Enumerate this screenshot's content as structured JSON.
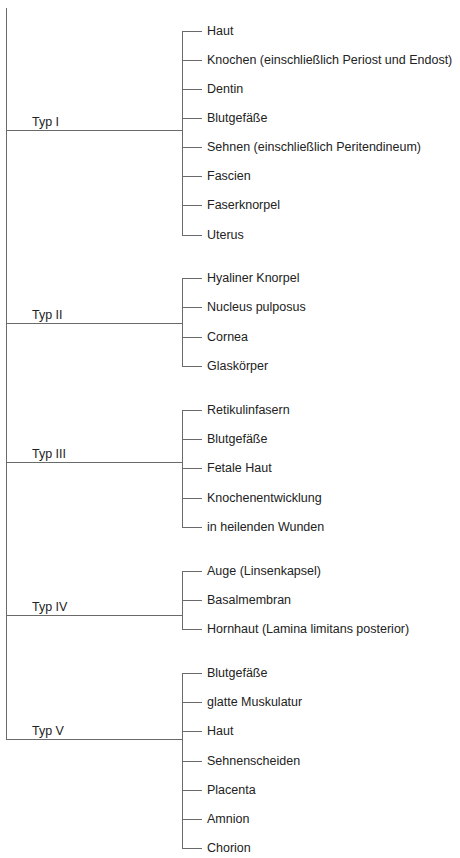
{
  "diagram": {
    "colors": {
      "line": "#6a6a6a",
      "text": "#222222",
      "background": "#ffffff"
    },
    "groups": [
      {
        "label": "Typ I",
        "y": 130,
        "items": [
          "Haut",
          "Knochen (einschließlich Periost und Endost)",
          "Dentin",
          "Blutgefäße",
          "Sehnen (einschließlich Peritendineum)",
          "Fascien",
          "Faserknorpel",
          "Uterus"
        ],
        "item_y": [
          31,
          60,
          89,
          118,
          147,
          176,
          205,
          235
        ]
      },
      {
        "label": "Typ II",
        "y": 323,
        "items": [
          "Hyaliner Knorpel",
          "Nucleus pulposus",
          "Cornea",
          "Glaskörper"
        ],
        "item_y": [
          278,
          307,
          337,
          366
        ]
      },
      {
        "label": "Typ III",
        "y": 462,
        "items": [
          "Retikulinfasern",
          "Blutgefäße",
          "Fetale Haut",
          "Knochenentwicklung",
          "in heilenden Wunden"
        ],
        "item_y": [
          410,
          439,
          468,
          498,
          527
        ]
      },
      {
        "label": "Typ IV",
        "y": 615,
        "items": [
          "Auge (Linsenkapsel)",
          "Basalmembran",
          "Hornhaut (Lamina limitans posterior)"
        ],
        "item_y": [
          571,
          600,
          629
        ]
      },
      {
        "label": "Typ V",
        "y": 739,
        "items": [
          "Blutgefäße",
          "glatte Muskulatur",
          "Haut",
          "Sehnenscheiden",
          "Placenta",
          "Amnion",
          "Chorion"
        ],
        "item_y": [
          673,
          702,
          731,
          761,
          790,
          819,
          848
        ]
      }
    ]
  }
}
